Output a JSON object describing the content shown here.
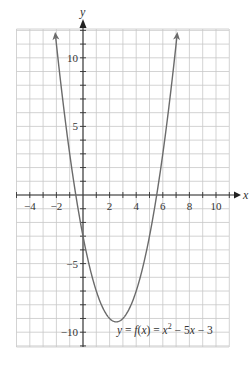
{
  "chart_data": {
    "type": "line",
    "title": "",
    "function": "y = f(x) = x^2 - 5x - 3",
    "equation_label": {
      "prefix": "y = ",
      "fx": "f",
      "paren_x": "(x)",
      "eq": " = x",
      "sup": "2",
      "rest": " − 5x − 3"
    },
    "xlabel": "x",
    "ylabel": "y",
    "xlim": [
      -5,
      11
    ],
    "ylim": [
      -11,
      12
    ],
    "grid": true,
    "x_ticks": [
      -4,
      -2,
      2,
      4,
      6,
      8,
      10
    ],
    "x_tick_labels": [
      "−4",
      "−2",
      "2",
      "4",
      "6",
      "8",
      "10"
    ],
    "y_ticks": [
      10,
      5,
      -5,
      -10
    ],
    "y_tick_labels": [
      "10",
      "5",
      "−5",
      "−10"
    ],
    "vertex": [
      2.5,
      -9.25
    ],
    "roots": [
      -0.54,
      5.54
    ],
    "y_intercept": -3,
    "series": [
      {
        "name": "f(x) = x^2 - 5x - 3",
        "x": [
          -2.1,
          -1,
          0,
          1,
          2,
          2.5,
          3,
          4,
          5,
          6,
          7.1
        ],
        "y": [
          11.91,
          3,
          -3,
          -7,
          -9,
          -9.25,
          -9,
          -7,
          -3,
          3,
          11.91
        ]
      }
    ],
    "colors": {
      "curve": "#6b6b6b",
      "grid": "#c8c8c8",
      "axis": "#333333"
    }
  }
}
